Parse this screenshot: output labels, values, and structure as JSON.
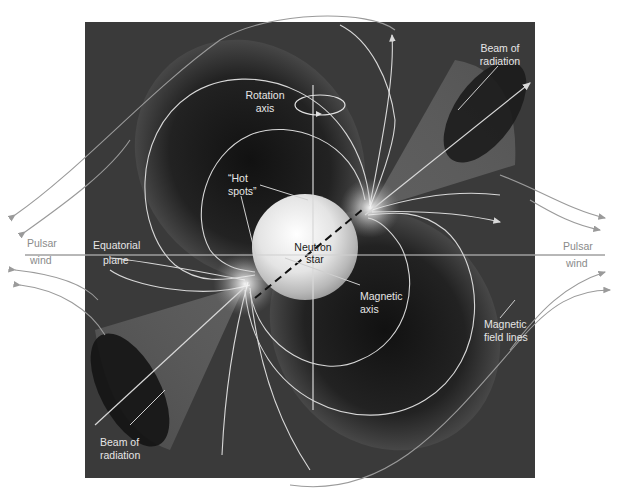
{
  "diagram": {
    "colors": {
      "background": "#ffffff",
      "panel": "#3a3a3a",
      "field_line": "#d8d8d8",
      "outside_line": "#9a9a9a",
      "outside_text": "#8a8a8a",
      "inside_text": "#e6e6e6",
      "star": "#e8e8e8"
    },
    "labels": {
      "rotation_axis": [
        "Rotation",
        "axis"
      ],
      "beam_top": [
        "Beam of",
        "radiation"
      ],
      "hot_spots": [
        "“Hot",
        "spots”"
      ],
      "equatorial_plane": [
        "Equatorial",
        "plane"
      ],
      "neutron_star": [
        "Neutron",
        "star"
      ],
      "magnetic_axis": [
        "Magnetic",
        "axis"
      ],
      "magnetic_field_lines": [
        "Magnetic",
        "field lines"
      ],
      "beam_bottom": [
        "Beam of",
        "radiation"
      ],
      "pulsar_wind_left": [
        "Pulsar",
        "wind"
      ],
      "pulsar_wind_right": [
        "Pulsar",
        "wind"
      ]
    }
  }
}
